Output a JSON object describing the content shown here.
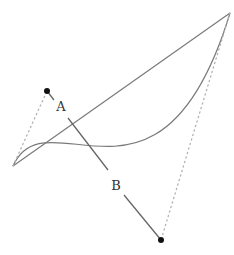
{
  "diagram": {
    "type": "bezier-curve-with-control-handles",
    "colors": {
      "curve": "#777777",
      "chord": "#777777",
      "handle": "#aaaaaa",
      "control_point": "#111111",
      "segment": "#666666",
      "background": "#ffffff"
    },
    "endpoints": {
      "start": {
        "x": 13,
        "y": 166
      },
      "end": {
        "x": 230,
        "y": 13
      }
    },
    "control_points": [
      {
        "name": "A",
        "x": 47,
        "y": 91
      },
      {
        "name": "B",
        "x": 161,
        "y": 240
      }
    ],
    "labels": {
      "a": "A",
      "b": "B"
    }
  }
}
